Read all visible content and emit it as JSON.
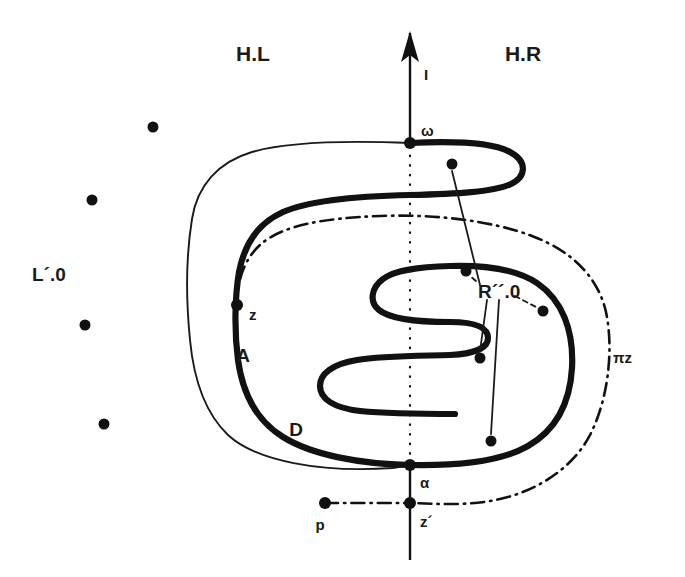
{
  "figure": {
    "background_color": "#ffffff",
    "ink_color": "#111111",
    "width": 685,
    "height": 577
  },
  "labels": {
    "half_plane_left": "H.L",
    "half_plane_right": "H.R",
    "axis": "I",
    "omega": "ω",
    "alpha": "α",
    "z": "z",
    "z_prime": "z´",
    "p": "p",
    "region_A": "A",
    "region_D": "D",
    "left_set": "L´.0",
    "right_set": "R´´.0",
    "pi_z": "πz"
  },
  "label_positions": {
    "half_plane_left": {
      "x": 253,
      "y": 61
    },
    "half_plane_right": {
      "x": 523,
      "y": 61
    },
    "axis": {
      "x": 424,
      "y": 77
    },
    "omega": {
      "x": 421,
      "y": 134
    },
    "alpha": {
      "x": 420,
      "y": 483
    },
    "z": {
      "x": 249,
      "y": 316
    },
    "z_prime": {
      "x": 420,
      "y": 526
    },
    "p": {
      "x": 320,
      "y": 527
    },
    "region_A": {
      "x": 243,
      "y": 355
    },
    "region_D": {
      "x": 296,
      "y": 429
    },
    "left_set": {
      "x": 32,
      "y": 274
    },
    "right_set": {
      "x": 478,
      "y": 291
    },
    "pi_z": {
      "x": 613,
      "y": 357
    }
  },
  "nodes": {
    "omega": {
      "x": 410,
      "y": 143,
      "r": 6,
      "label": "ω",
      "on": "vertical-axis"
    },
    "alpha": {
      "x": 410,
      "y": 465,
      "r": 6,
      "label": "α",
      "on": "vertical-axis"
    },
    "z_prime": {
      "x": 410,
      "y": 503,
      "r": 6,
      "label": "z´",
      "on": "vertical-axis"
    },
    "z": {
      "x": 237,
      "y": 305,
      "r": 6,
      "label": "z",
      "on": "thick-curve"
    },
    "p": {
      "x": 325,
      "y": 503,
      "r": 6,
      "label": "p",
      "on": "dashdot-line"
    }
  },
  "left_points": [
    {
      "x": 153,
      "y": 127,
      "r": 5.5
    },
    {
      "x": 92,
      "y": 200,
      "r": 5.5
    },
    {
      "x": 85,
      "y": 325,
      "r": 5.5
    },
    {
      "x": 104,
      "y": 424,
      "r": 5.5
    }
  ],
  "right_points": [
    {
      "x": 452,
      "y": 164,
      "r": 5.5
    },
    {
      "x": 466,
      "y": 271,
      "r": 5.5
    },
    {
      "x": 543,
      "y": 311,
      "r": 5.5
    },
    {
      "x": 480,
      "y": 358,
      "r": 5.5
    },
    {
      "x": 491,
      "y": 441,
      "r": 5.5
    }
  ],
  "axis": {
    "x": 410,
    "top_y": 33,
    "bottom_y": 560,
    "arrow_tip_y": 33,
    "arrow_half_width": 9,
    "arrow_length": 26
  },
  "leaders": [
    {
      "name": "leader-to-top-point",
      "from": {
        "x": 480,
        "y": 285
      },
      "to": {
        "x": 452,
        "y": 170
      },
      "style": "solid"
    },
    {
      "name": "leader-to-mid-point",
      "from": {
        "x": 475,
        "y": 281
      },
      "to": {
        "x": 471,
        "y": 276
      },
      "style": "dashed"
    },
    {
      "name": "leader-to-right-point",
      "from": {
        "x": 514,
        "y": 295
      },
      "to": {
        "x": 536,
        "y": 307
      },
      "style": "dashed"
    },
    {
      "name": "leader-to-lower-point",
      "from": {
        "x": 487,
        "y": 300
      },
      "to": {
        "x": 480,
        "y": 352
      },
      "style": "solid"
    },
    {
      "name": "leader-to-bottom-point",
      "from": {
        "x": 498,
        "y": 300
      },
      "to": {
        "x": 491,
        "y": 434
      },
      "style": "solid"
    }
  ],
  "curves": {
    "thick_spiral_label": "A",
    "thin_outer_label": "D",
    "dashdot_label": "πz"
  }
}
